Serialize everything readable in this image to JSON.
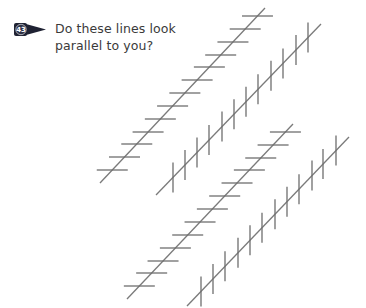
{
  "badge": {
    "number": "43",
    "color": "#1f2233"
  },
  "question": {
    "line1": "Do these lines look",
    "line2": "parallel to you?"
  },
  "illusion": {
    "name": "Zöllner illusion",
    "line_color": "#7a7a7a",
    "tick_color": "#6e6e6e",
    "lines": [
      {
        "id": "line-1",
        "x1": 265,
        "y1": 8,
        "x2": 100,
        "y2": 183,
        "tick_orientation": "horizontal",
        "tick_length": 31,
        "tick_positions": [
          16,
          29,
          42,
          55,
          67,
          80,
          93,
          106,
          119,
          132,
          144,
          157,
          170
        ]
      },
      {
        "id": "line-2",
        "x1": 321,
        "y1": 24,
        "x2": 156,
        "y2": 195,
        "tick_orientation": "vertical",
        "tick_length": 30,
        "tick_positions": [
          173,
          185,
          197,
          209,
          222,
          234,
          246,
          258,
          271,
          283,
          296,
          308
        ]
      },
      {
        "id": "line-3",
        "x1": 293,
        "y1": 124,
        "x2": 127,
        "y2": 299,
        "tick_orientation": "horizontal",
        "tick_length": 31,
        "tick_positions": [
          132,
          145,
          158,
          170,
          183,
          196,
          209,
          222,
          235,
          248,
          261,
          273,
          286
        ]
      },
      {
        "id": "line-4",
        "x1": 349,
        "y1": 137,
        "x2": 187,
        "y2": 306,
        "tick_orientation": "vertical",
        "tick_length": 30,
        "tick_positions": [
          201,
          213,
          225,
          238,
          250,
          262,
          275,
          287,
          299,
          312,
          323,
          336
        ]
      }
    ]
  }
}
